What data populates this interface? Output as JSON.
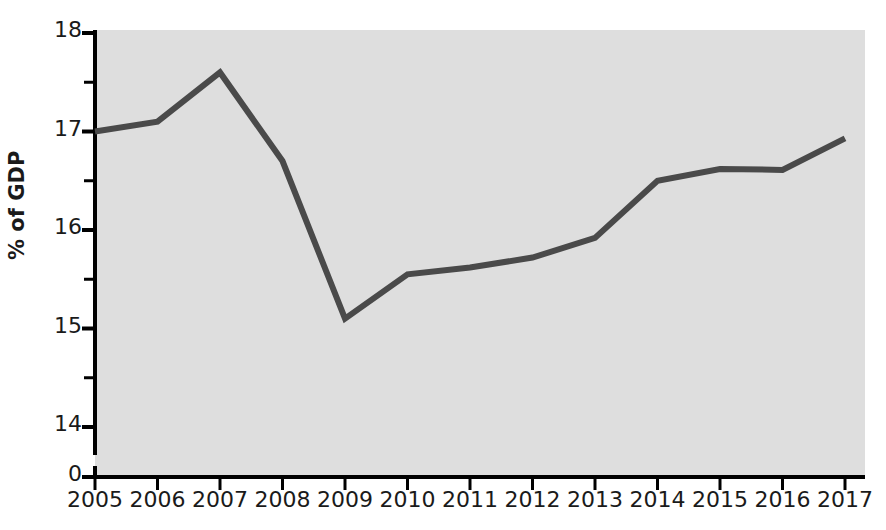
{
  "chart_data": {
    "type": "line",
    "title": "",
    "subtitle": "",
    "xlabel": "",
    "ylabel": "% of GDP",
    "x": [
      2005,
      2006,
      2007,
      2008,
      2009,
      2010,
      2011,
      2012,
      2013,
      2014,
      2015,
      2016,
      2017
    ],
    "categories": [
      "2005",
      "2006",
      "2007",
      "2008",
      "2009",
      "2010",
      "2011",
      "2012",
      "2013",
      "2014",
      "2015",
      "2016",
      "2017"
    ],
    "values": [
      17.0,
      17.1,
      17.6,
      16.7,
      15.1,
      15.55,
      15.62,
      15.72,
      15.92,
      16.5,
      16.62,
      16.61,
      16.93
    ],
    "series": [
      {
        "name": "% of GDP",
        "values": [
          17.0,
          17.1,
          17.6,
          16.7,
          15.1,
          15.55,
          15.62,
          15.72,
          15.92,
          16.5,
          16.62,
          16.61,
          16.93
        ],
        "color": "#4a4a4a"
      }
    ],
    "xlim": [
      2005,
      2017
    ],
    "ylim": [
      14,
      18
    ],
    "y_axis_broken": true,
    "y_axis_break_label": "0",
    "ytick_labels": [
      "18",
      "17",
      "16",
      "15",
      "14",
      "0"
    ],
    "ytick_values": [
      18,
      17,
      16,
      15,
      14,
      0
    ],
    "yminor_ticks": [
      17.5,
      16.5,
      15.5,
      14.5
    ],
    "grid": false,
    "legend": "none",
    "annotations": [],
    "plot_background_color": "#dedede",
    "line_color": "#4a4a4a",
    "axis_color": "#000000",
    "text_color": "#1a1a1a"
  },
  "axis": {
    "y_title": "% of GDP"
  }
}
